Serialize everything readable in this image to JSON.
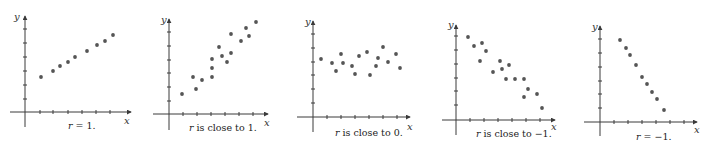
{
  "chart_data": [
    {
      "type": "scatter",
      "title": "",
      "caption": "r = 1.",
      "caption_var": "r",
      "caption_rest": " = 1.",
      "xlabel": "x",
      "ylabel": "y",
      "grid": false,
      "origin": [
        25,
        112
      ],
      "y_top": 16,
      "y_bottom": 127,
      "x_left": 10,
      "x_right": 131,
      "caption_pos": [
        68,
        129
      ],
      "xlabel_pos": [
        124,
        124
      ],
      "ylabel_pos": [
        14,
        20
      ],
      "x_ticks": [
        40,
        53,
        68,
        82,
        96,
        110
      ],
      "y_ticks": [
        29,
        43,
        57,
        71,
        85,
        99
      ],
      "points": [
        [
          41,
          77
        ],
        [
          53,
          71
        ],
        [
          60,
          66
        ],
        [
          68,
          62
        ],
        [
          75,
          57
        ],
        [
          87,
          51
        ],
        [
          97,
          45
        ],
        [
          105,
          41
        ],
        [
          113,
          35
        ]
      ]
    },
    {
      "type": "scatter",
      "title": "",
      "caption": "r is close to 1.",
      "caption_var": "r",
      "caption_rest": " is close to 1.",
      "xlabel": "x",
      "ylabel": "y",
      "grid": false,
      "origin": [
        169,
        114
      ],
      "y_top": 19,
      "y_bottom": 130,
      "x_left": 153,
      "x_right": 268,
      "caption_pos": [
        189,
        131
      ],
      "xlabel_pos": [
        264,
        126
      ],
      "ylabel_pos": [
        161,
        23
      ],
      "x_ticks": [
        183,
        197,
        211,
        225,
        239,
        253
      ],
      "y_ticks": [
        32,
        46,
        60,
        73,
        87,
        101
      ],
      "points": [
        [
          182,
          94
        ],
        [
          193,
          77
        ],
        [
          196,
          89
        ],
        [
          202,
          80
        ],
        [
          212,
          77
        ],
        [
          212,
          68
        ],
        [
          212,
          59
        ],
        [
          219,
          47
        ],
        [
          222,
          56
        ],
        [
          227,
          62
        ],
        [
          231,
          53
        ],
        [
          231,
          34
        ],
        [
          241,
          41
        ],
        [
          246,
          28
        ],
        [
          249,
          36
        ],
        [
          256,
          22
        ]
      ]
    },
    {
      "type": "scatter",
      "title": "",
      "caption": "r is close to 0.",
      "caption_var": "r",
      "caption_rest": " is close to 0.",
      "xlabel": "x",
      "ylabel": "y",
      "grid": false,
      "origin": [
        313,
        117
      ],
      "y_top": 21,
      "y_bottom": 132,
      "x_left": 297,
      "x_right": 410,
      "caption_pos": [
        335,
        136
      ],
      "xlabel_pos": [
        407,
        130
      ],
      "ylabel_pos": [
        305,
        25
      ],
      "x_ticks": [
        327,
        341,
        355,
        369,
        383,
        397
      ],
      "y_ticks": [
        34,
        48,
        62,
        75,
        89,
        103
      ],
      "points": [
        [
          321,
          59
        ],
        [
          332,
          63
        ],
        [
          336,
          71
        ],
        [
          341,
          54
        ],
        [
          343,
          63
        ],
        [
          352,
          66
        ],
        [
          355,
          74
        ],
        [
          359,
          56
        ],
        [
          367,
          52
        ],
        [
          370,
          75
        ],
        [
          376,
          66
        ],
        [
          378,
          58
        ],
        [
          383,
          47
        ],
        [
          388,
          62
        ],
        [
          396,
          54
        ],
        [
          400,
          68
        ]
      ]
    },
    {
      "type": "scatter",
      "title": "",
      "caption": "r is close to −1.",
      "caption_var": "r",
      "caption_rest": " is close to −1.",
      "xlabel": "x",
      "ylabel": "y",
      "grid": false,
      "origin": [
        456,
        120
      ],
      "y_top": 25,
      "y_bottom": 135,
      "x_left": 442,
      "x_right": 555,
      "caption_pos": [
        476,
        137
      ],
      "xlabel_pos": [
        551,
        130
      ],
      "ylabel_pos": [
        448,
        28
      ],
      "x_ticks": [
        470,
        484,
        498,
        512,
        526,
        540
      ],
      "y_ticks": [
        36,
        50,
        64,
        78,
        91,
        105
      ],
      "points": [
        [
          468,
          37
        ],
        [
          474,
          46
        ],
        [
          482,
          43
        ],
        [
          486,
          51
        ],
        [
          480,
          61
        ],
        [
          493,
          72
        ],
        [
          500,
          61
        ],
        [
          502,
          69
        ],
        [
          509,
          65
        ],
        [
          506,
          79
        ],
        [
          515,
          79
        ],
        [
          524,
          79
        ],
        [
          528,
          89
        ],
        [
          524,
          97
        ],
        [
          537,
          94
        ],
        [
          542,
          108
        ]
      ]
    },
    {
      "type": "scatter",
      "title": "",
      "caption": "r = −1.",
      "caption_var": "r",
      "caption_rest": " = −1.",
      "xlabel": "x",
      "ylabel": "y",
      "grid": false,
      "origin": [
        600,
        122
      ],
      "y_top": 26,
      "y_bottom": 136,
      "x_left": 584,
      "x_right": 697,
      "caption_pos": [
        636,
        140
      ],
      "xlabel_pos": [
        694,
        133
      ],
      "ylabel_pos": [
        592,
        30
      ],
      "x_ticks": [
        614,
        628,
        642,
        656,
        670,
        684
      ],
      "y_ticks": [
        39,
        53,
        67,
        81,
        94,
        108
      ],
      "points": [
        [
          620,
          40
        ],
        [
          626,
          48
        ],
        [
          630,
          55
        ],
        [
          636,
          65
        ],
        [
          642,
          77
        ],
        [
          647,
          84
        ],
        [
          652,
          92
        ],
        [
          657,
          99
        ],
        [
          664,
          110
        ]
      ]
    }
  ]
}
